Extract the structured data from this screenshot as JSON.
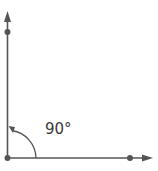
{
  "diagram": {
    "angle_label": "90°",
    "colors": {
      "stroke": "#555555",
      "text": "#3a3a3a",
      "background": "#ffffff"
    },
    "elements": {
      "vertex": "vertex-point",
      "ray_vertical": "ray-up",
      "ray_horizontal": "ray-right",
      "arc": "angle-arc-with-arrow",
      "points": [
        "point-on-vertical-ray",
        "vertex-point",
        "point-on-horizontal-ray"
      ]
    }
  }
}
